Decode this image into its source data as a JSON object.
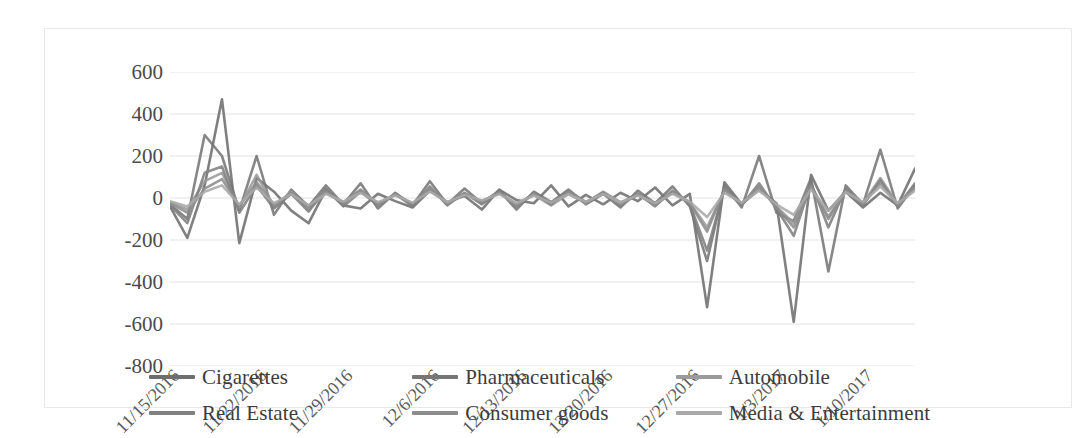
{
  "chart_data": {
    "type": "line",
    "title": "",
    "xlabel": "",
    "ylabel": "",
    "ylim": [
      -800,
      600
    ],
    "yticks": [
      600,
      400,
      200,
      0,
      -200,
      -400,
      -600,
      -800
    ],
    "ytick_labels": [
      "600",
      "400",
      "200",
      "0",
      "-200",
      "-400",
      "-600",
      "-800"
    ],
    "grid": true,
    "legend_position": "bottom",
    "xtick_labels": [
      "11/15/2016",
      "11/22/2016",
      "11/29/2016",
      "12/6/2016",
      "12/13/2016",
      "12/20/2016",
      "12/27/2016",
      "1/3/2017",
      "1/10/2017"
    ],
    "xtick_positions": [
      0,
      5,
      10,
      15,
      20,
      25,
      30,
      35,
      40
    ],
    "x_count": 44,
    "series": [
      {
        "name": "Cigarettes",
        "color": "#6e6e6e",
        "values": [
          -40,
          -190,
          60,
          470,
          -215,
          95,
          30,
          -60,
          -120,
          40,
          -35,
          -50,
          20,
          -15,
          -45,
          35,
          -20,
          10,
          -55,
          40,
          -10,
          -25,
          60,
          -40,
          15,
          -30,
          25,
          -15,
          50,
          -35,
          20,
          -520,
          75,
          -30,
          40,
          -25,
          -590,
          110,
          -60,
          30,
          -45,
          25,
          -35,
          140
        ]
      },
      {
        "name": "Pharmaceuticals",
        "color": "#767676",
        "values": [
          -30,
          -100,
          300,
          200,
          -60,
          200,
          -80,
          40,
          -40,
          60,
          -30,
          70,
          -50,
          25,
          -35,
          80,
          -30,
          45,
          -25,
          35,
          -55,
          30,
          -20,
          40,
          -30,
          20,
          -45,
          35,
          -25,
          55,
          -40,
          -300,
          60,
          -45,
          200,
          -70,
          -110,
          95,
          -350,
          60,
          -30,
          230,
          -50,
          60
        ]
      },
      {
        "name": "Automobile",
        "color": "#9a9a9a",
        "values": [
          -20,
          -55,
          80,
          120,
          -45,
          110,
          -40,
          30,
          -55,
          25,
          -20,
          35,
          -25,
          15,
          -30,
          40,
          -25,
          20,
          -15,
          25,
          -30,
          15,
          -35,
          20,
          -25,
          30,
          -20,
          15,
          -30,
          25,
          -20,
          -140,
          35,
          -30,
          50,
          -40,
          -120,
          60,
          -90,
          40,
          -25,
          95,
          -30,
          45
        ]
      },
      {
        "name": "Real Estate",
        "color": "#808080",
        "values": [
          -35,
          -120,
          120,
          150,
          -70,
          60,
          -50,
          20,
          -65,
          45,
          -40,
          30,
          -35,
          20,
          -40,
          55,
          -35,
          25,
          -30,
          30,
          -40,
          25,
          -30,
          35,
          -20,
          25,
          -35,
          20,
          -40,
          35,
          -30,
          -250,
          45,
          -35,
          70,
          -50,
          -180,
          70,
          -140,
          45,
          -35,
          85,
          -40,
          70
        ]
      },
      {
        "name": "Consumer goods",
        "color": "#8c8c8c",
        "values": [
          -25,
          -70,
          45,
          90,
          -40,
          75,
          -35,
          25,
          -45,
          30,
          -25,
          40,
          -30,
          18,
          -28,
          45,
          -28,
          22,
          -20,
          28,
          -35,
          20,
          -28,
          30,
          -22,
          22,
          -30,
          18,
          -32,
          30,
          -25,
          -160,
          40,
          -32,
          55,
          -45,
          -140,
          55,
          -100,
          35,
          -28,
          70,
          -35,
          50
        ]
      },
      {
        "name": "Media & Entertainment",
        "color": "#a8a8a8",
        "values": [
          -15,
          -40,
          30,
          60,
          -30,
          50,
          -25,
          18,
          -35,
          20,
          -18,
          25,
          -20,
          12,
          -22,
          30,
          -20,
          15,
          -12,
          18,
          -25,
          12,
          -22,
          18,
          -18,
          20,
          -22,
          12,
          -25,
          20,
          -18,
          -90,
          25,
          -22,
          35,
          -30,
          -80,
          40,
          -60,
          28,
          -20,
          55,
          -25,
          35
        ]
      }
    ]
  },
  "legend": {
    "items": [
      {
        "label": "Cigarettes"
      },
      {
        "label": "Pharmaceuticals"
      },
      {
        "label": "Automobile"
      },
      {
        "label": "Real Estate"
      },
      {
        "label": "Consumer goods"
      },
      {
        "label": "Media & Entertainment"
      }
    ]
  },
  "colors": {
    "gridline": "#e3e3e3",
    "frame": "#e8e8e8",
    "tick_text": "#4a4a4a",
    "background": "#ffffff"
  }
}
